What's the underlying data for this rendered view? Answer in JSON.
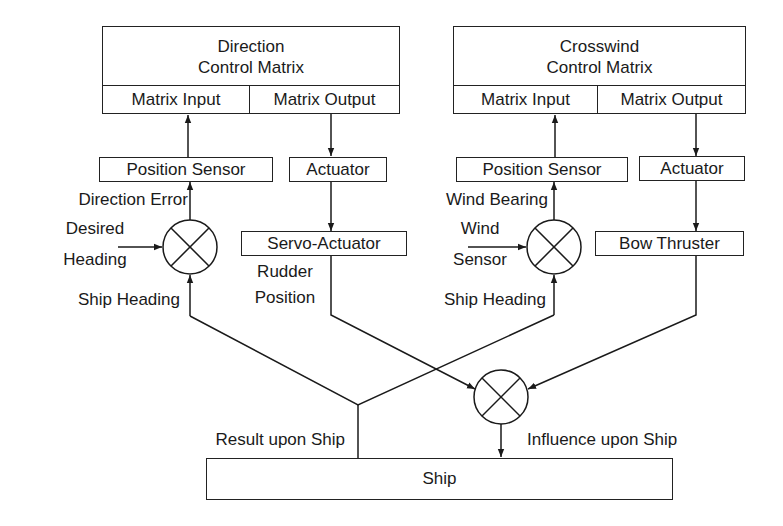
{
  "diagram": {
    "direction_matrix": {
      "title_line1": "Direction",
      "title_line2": "Control Matrix",
      "input_port": "Matrix Input",
      "output_port": "Matrix Output"
    },
    "crosswind_matrix": {
      "title_line1": "Crosswind",
      "title_line2": "Control Matrix",
      "input_port": "Matrix Input",
      "output_port": "Matrix Output"
    },
    "left_branch": {
      "position_sensor": "Position Sensor",
      "actuator": "Actuator",
      "servo_actuator": "Servo-Actuator",
      "error_label": "Direction Error",
      "desired_line1": "Desired",
      "desired_line2": "Heading",
      "ship_heading": "Ship Heading",
      "rudder_line1": "Rudder",
      "rudder_line2": "Position"
    },
    "right_branch": {
      "position_sensor": "Position Sensor",
      "actuator": "Actuator",
      "bow_thruster": "Bow Thruster",
      "bearing_label": "Wind Bearing",
      "wind_line1": "Wind",
      "wind_line2": "Sensor",
      "ship_heading": "Ship Heading"
    },
    "bottom": {
      "result_label": "Result upon Ship",
      "influence_label": "Influence upon Ship",
      "ship": "Ship"
    },
    "symbols": {
      "summing_junction": "multiply-circle-icon",
      "count": 3
    }
  }
}
